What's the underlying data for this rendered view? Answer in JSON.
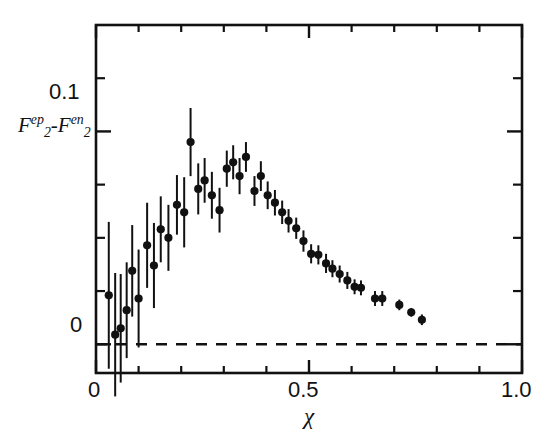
{
  "figure": {
    "background_color": "#ffffff",
    "ink_color": "#111111"
  },
  "axes": {
    "x": {
      "label": "χ",
      "tick_labels": [
        "0",
        "0.5",
        "1.0"
      ],
      "tick_values": [
        0,
        0.5,
        1.0
      ],
      "minor_tick_values": [
        0.1,
        0.2,
        0.3,
        0.4,
        0.6,
        0.7,
        0.8,
        0.9
      ],
      "range": [
        0,
        1.0
      ]
    },
    "y": {
      "label_parts": {
        "f1_base": "F",
        "f1_sup": "ep",
        "f1_sub": "2",
        "minus": "-",
        "f2_base": "F",
        "f2_sup": "en",
        "f2_sub": "2"
      },
      "label_plain": "F2ep-F2en",
      "tick_labels": [
        "0.1",
        "0"
      ],
      "tick_values": [
        0.1,
        0.0
      ],
      "minor_tick_values": [
        0.125,
        0.075,
        0.05,
        0.025
      ],
      "range": [
        -0.0135,
        0.15
      ]
    },
    "zero_line": {
      "value": 0,
      "style": "dashed"
    },
    "grid": false,
    "frame": true
  },
  "chart_data": {
    "type": "scatter",
    "title": "",
    "xlabel": "χ",
    "ylabel": "F_2^{ep} - F_2^{en}",
    "xlim": [
      0,
      1.0
    ],
    "ylim": [
      -0.0135,
      0.15
    ],
    "grid": false,
    "legend": null,
    "marker": "filled-circle-with-error-bars",
    "series": [
      {
        "name": "F2ep - F2en",
        "points": [
          {
            "x": 0.03,
            "y": 0.023,
            "yerr": 0.0345
          },
          {
            "x": 0.045,
            "y": 0.0045,
            "yerr": 0.029
          },
          {
            "x": 0.058,
            "y": 0.0075,
            "yerr": 0.0255
          },
          {
            "x": 0.072,
            "y": 0.016,
            "yerr": 0.0225
          },
          {
            "x": 0.085,
            "y": 0.0345,
            "yerr": 0.0215
          },
          {
            "x": 0.1,
            "y": 0.0215,
            "yerr": 0.023
          },
          {
            "x": 0.12,
            "y": 0.0465,
            "yerr": 0.02
          },
          {
            "x": 0.136,
            "y": 0.037,
            "yerr": 0.02
          },
          {
            "x": 0.152,
            "y": 0.054,
            "yerr": 0.0155
          },
          {
            "x": 0.17,
            "y": 0.05,
            "yerr": 0.0155
          },
          {
            "x": 0.19,
            "y": 0.0655,
            "yerr": 0.014
          },
          {
            "x": 0.207,
            "y": 0.062,
            "yerr": 0.0165
          },
          {
            "x": 0.222,
            "y": 0.095,
            "yerr": 0.016
          },
          {
            "x": 0.24,
            "y": 0.073,
            "yerr": 0.012
          },
          {
            "x": 0.255,
            "y": 0.077,
            "yerr": 0.0105
          },
          {
            "x": 0.272,
            "y": 0.07,
            "yerr": 0.011
          },
          {
            "x": 0.29,
            "y": 0.063,
            "yerr": 0.0105
          },
          {
            "x": 0.307,
            "y": 0.0825,
            "yerr": 0.0085
          },
          {
            "x": 0.322,
            "y": 0.0855,
            "yerr": 0.008
          },
          {
            "x": 0.337,
            "y": 0.079,
            "yerr": 0.0085
          },
          {
            "x": 0.352,
            "y": 0.088,
            "yerr": 0.007
          },
          {
            "x": 0.372,
            "y": 0.072,
            "yerr": 0.007
          },
          {
            "x": 0.387,
            "y": 0.079,
            "yerr": 0.007
          },
          {
            "x": 0.403,
            "y": 0.07,
            "yerr": 0.0065
          },
          {
            "x": 0.42,
            "y": 0.0665,
            "yerr": 0.006
          },
          {
            "x": 0.437,
            "y": 0.062,
            "yerr": 0.0055
          },
          {
            "x": 0.452,
            "y": 0.058,
            "yerr": 0.0055
          },
          {
            "x": 0.47,
            "y": 0.0545,
            "yerr": 0.005
          },
          {
            "x": 0.487,
            "y": 0.0485,
            "yerr": 0.005
          },
          {
            "x": 0.505,
            "y": 0.0425,
            "yerr": 0.0045
          },
          {
            "x": 0.522,
            "y": 0.042,
            "yerr": 0.0045
          },
          {
            "x": 0.54,
            "y": 0.038,
            "yerr": 0.0045
          },
          {
            "x": 0.555,
            "y": 0.0355,
            "yerr": 0.004
          },
          {
            "x": 0.572,
            "y": 0.033,
            "yerr": 0.004
          },
          {
            "x": 0.59,
            "y": 0.03,
            "yerr": 0.004
          },
          {
            "x": 0.607,
            "y": 0.027,
            "yerr": 0.0035
          },
          {
            "x": 0.622,
            "y": 0.0265,
            "yerr": 0.0035
          },
          {
            "x": 0.655,
            "y": 0.0215,
            "yerr": 0.0035
          },
          {
            "x": 0.672,
            "y": 0.0215,
            "yerr": 0.0035
          },
          {
            "x": 0.712,
            "y": 0.0185,
            "yerr": 0.0025
          },
          {
            "x": 0.74,
            "y": 0.015,
            "yerr": 0.002
          },
          {
            "x": 0.765,
            "y": 0.0115,
            "yerr": 0.0025
          }
        ]
      }
    ]
  }
}
